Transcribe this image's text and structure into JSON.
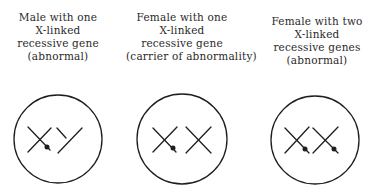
{
  "panels": [
    {
      "label_lines": [
        "Male with one",
        "X-linked",
        "recessive gene",
        "(abnormal)"
      ],
      "genotype": "XY",
      "marked_chromosomes": [
        "X"
      ]
    },
    {
      "label_lines": [
        "Female with one",
        "X-linked",
        "recessive gene",
        "(carrier of abnormality)"
      ],
      "genotype": "XX",
      "marked_chromosomes": [
        "X (first)"
      ]
    },
    {
      "label_lines": [
        "Female with two",
        "X-linked",
        "recessive genes",
        "(abnormal)"
      ],
      "genotype": "XX",
      "marked_chromosomes": [
        "X (first)",
        "X (second)"
      ]
    }
  ],
  "colors": {
    "ink": "#1e1e1e",
    "background": "#ffffff"
  }
}
